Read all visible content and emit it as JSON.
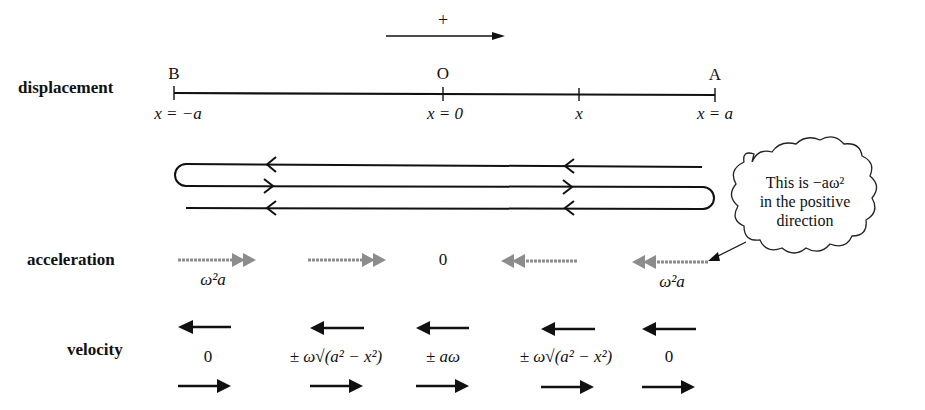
{
  "direction_indicator": {
    "label": "+"
  },
  "rows": {
    "displacement": "displacement",
    "acceleration": "acceleration",
    "velocity": "velocity"
  },
  "displacement": {
    "points": [
      {
        "name": "B",
        "label": "x = −a",
        "x": 175
      },
      {
        "name": "O",
        "label": "x = 0",
        "x": 443
      },
      {
        "name": "",
        "label": "x",
        "x": 579
      },
      {
        "name": "A",
        "label": "x = a",
        "x": 715
      }
    ]
  },
  "acceleration": {
    "values": [
      {
        "x": 215,
        "label": "ω²a",
        "direction": "right"
      },
      {
        "x": 343,
        "label": "",
        "direction": "right"
      },
      {
        "x": 443,
        "label": "0",
        "direction": "none"
      },
      {
        "x": 537,
        "label": "",
        "direction": "left"
      },
      {
        "x": 672,
        "label": "ω²a",
        "direction": "left"
      }
    ]
  },
  "velocity": {
    "values": [
      {
        "x": 208,
        "label": "0"
      },
      {
        "x": 336,
        "label": "± ω√(a² − x²)"
      },
      {
        "x": 443,
        "label": "± aω"
      },
      {
        "x": 566,
        "label": "± ω√(a² − x²)"
      },
      {
        "x": 669,
        "label": "0"
      }
    ]
  },
  "callout": {
    "line1": "This is −aω²",
    "line2": "in the positive",
    "line3": "direction"
  },
  "colors": {
    "ink": "#111111",
    "accel_arrow": "#8c8c8c",
    "background": "#ffffff"
  }
}
